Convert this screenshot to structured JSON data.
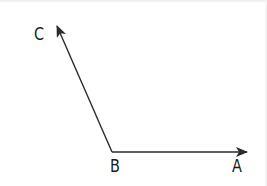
{
  "diagram": {
    "type": "angle",
    "vertex": {
      "label": "B",
      "x": 112,
      "y": 150
    },
    "rays": [
      {
        "name": "BA",
        "from": "B",
        "to": "A",
        "end": {
          "x": 247,
          "y": 150
        }
      },
      {
        "name": "BC",
        "from": "B",
        "to": "C",
        "end": {
          "x": 57,
          "y": 24
        }
      }
    ],
    "points": {
      "A": {
        "label": "A"
      },
      "B": {
        "label": "B"
      },
      "C": {
        "label": "C"
      }
    },
    "colors": {
      "stroke": "#2b2b2b",
      "text": "#1a1a1a",
      "background": "#ffffff"
    }
  }
}
